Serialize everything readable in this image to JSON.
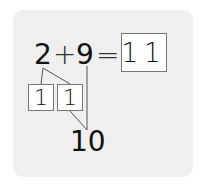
{
  "equation": {
    "addend1": "2",
    "plus": "+",
    "addend2": "9",
    "equals": "=",
    "answer": "11"
  },
  "decomposition": {
    "part1": "1",
    "part2": "1",
    "ten_label": "10"
  },
  "colors": {
    "panel": "#efefef",
    "ink": "#111111",
    "box_border": "#777777",
    "line": "#555555"
  }
}
